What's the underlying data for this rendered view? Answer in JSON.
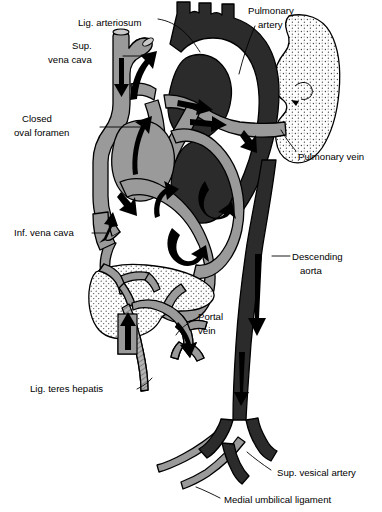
{
  "figure": {
    "type": "anatomical-diagram",
    "background_color": "#ffffff",
    "palette": {
      "oxygenated_dark": "#2b2b2b",
      "deoxygenated_gray": "#9a9a9a",
      "organ_stipple_fill": "#fdfdfd",
      "outline": "#000000",
      "arrow_fill": "#000000"
    }
  },
  "labels": [
    {
      "id": "lig-arteriosum",
      "text": "Lig. arteriosum",
      "lines": [
        "Lig. arteriosum"
      ],
      "x": 78,
      "y": 22,
      "anchor": "start"
    },
    {
      "id": "pulmonary-artery",
      "text": "Pulmonary artery",
      "lines": [
        "Pulmonary",
        "artery"
      ],
      "x": 248,
      "y": 10,
      "anchor": "start"
    },
    {
      "id": "sup-vena-cava",
      "text": "Sup. vena cava",
      "lines": [
        "Sup.",
        "vena cava"
      ],
      "x": 68,
      "y": 45,
      "anchor": "start"
    },
    {
      "id": "closed-oval-foramen",
      "text": "Closed oval foramen",
      "lines": [
        "Closed",
        "oval foramen"
      ],
      "x": 20,
      "y": 118,
      "anchor": "start"
    },
    {
      "id": "pulmonary-vein",
      "text": "Pulmonary vein",
      "lines": [
        "Pulmonary vein"
      ],
      "x": 298,
      "y": 157,
      "anchor": "start"
    },
    {
      "id": "inf-vena-cava",
      "text": "Inf. vena cava",
      "lines": [
        "Inf. vena cava"
      ],
      "x": 14,
      "y": 236,
      "anchor": "start"
    },
    {
      "id": "descending-aorta",
      "text": "Descending aorta",
      "lines": [
        "Descending",
        "aorta"
      ],
      "x": 292,
      "y": 260,
      "anchor": "start"
    },
    {
      "id": "portal-vein",
      "text": "Portal vein",
      "lines": [
        "Portal",
        "vein"
      ],
      "x": 196,
      "y": 317,
      "anchor": "start"
    },
    {
      "id": "lig-teres-hepatis",
      "text": "Lig. teres hepatis",
      "lines": [
        "Lig. teres hepatis"
      ],
      "x": 30,
      "y": 392,
      "anchor": "start"
    },
    {
      "id": "sup-vesical-artery",
      "text": "Sup. vesical artery",
      "lines": [
        "Sup. vesical artery"
      ],
      "x": 273,
      "y": 473,
      "anchor": "start"
    },
    {
      "id": "medial-umbilical-ligament",
      "text": "Medial umbilical ligament",
      "lines": [
        "Medial umbilical ligament"
      ],
      "x": 222,
      "y": 501,
      "anchor": "start"
    }
  ],
  "structures": [
    {
      "id": "aortic-arch",
      "name": "Aortic arch with brachiocephalic branches",
      "shade": "dark"
    },
    {
      "id": "superior-vena-cava",
      "name": "Superior vena cava",
      "shade": "gray"
    },
    {
      "id": "right-atrium",
      "name": "Right atrium",
      "shade": "gray"
    },
    {
      "id": "left-atrium",
      "name": "Left atrium",
      "shade": "dark"
    },
    {
      "id": "right-ventricle",
      "name": "Right ventricle",
      "shade": "gray"
    },
    {
      "id": "left-ventricle",
      "name": "Left ventricle",
      "shade": "dark"
    },
    {
      "id": "pulmonary-trunk",
      "name": "Pulmonary trunk and branches",
      "shade": "gray"
    },
    {
      "id": "lung",
      "name": "Lung",
      "shade": "stipple"
    },
    {
      "id": "liver",
      "name": "Liver",
      "shade": "stipple"
    },
    {
      "id": "portal-vein-vessel",
      "name": "Portal vein",
      "shade": "gray"
    },
    {
      "id": "descending-aorta-vessel",
      "name": "Descending aorta",
      "shade": "dark"
    },
    {
      "id": "iliac-arteries",
      "name": "Common iliac arteries",
      "shade": "dark"
    },
    {
      "id": "umbilical-ligaments",
      "name": "Medial umbilical ligaments",
      "shade": "gray"
    },
    {
      "id": "ligamentum-teres",
      "name": "Ligamentum teres hepatis",
      "shade": "gray"
    }
  ],
  "flow_arrows": [
    {
      "id": "svc-flow",
      "direction": "down",
      "location": "superior vena cava"
    },
    {
      "id": "ivc-flow",
      "direction": "up",
      "location": "inferior vena cava"
    },
    {
      "id": "ra-flow",
      "direction": "up",
      "location": "right atrium"
    },
    {
      "id": "rv-flow",
      "direction": "up",
      "location": "right ventricle outflow"
    },
    {
      "id": "lv-flow",
      "direction": "up",
      "location": "left ventricle outflow"
    },
    {
      "id": "arch-flow",
      "direction": "up",
      "location": "aortic arch"
    },
    {
      "id": "pulm-artery-flow",
      "direction": "right",
      "location": "pulmonary artery to lung"
    },
    {
      "id": "lung-flow",
      "direction": "curve",
      "location": "lung hilum"
    },
    {
      "id": "aorta-flow",
      "direction": "down",
      "location": "descending aorta"
    },
    {
      "id": "portal-flow",
      "direction": "up",
      "location": "portal vein to liver"
    }
  ]
}
